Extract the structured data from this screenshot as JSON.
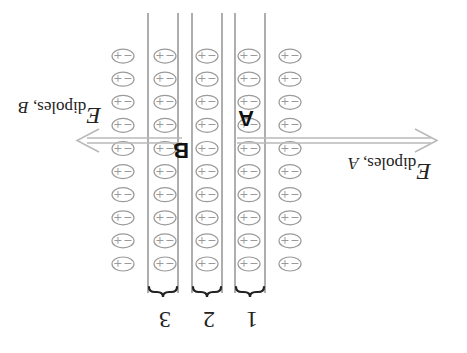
{
  "figure": {
    "orientation": "rotated-180",
    "colors": {
      "dipole": "#9a9a9a",
      "layer_line": "#9a9a9a",
      "arrow": "#b8b8b8",
      "text": "#222222",
      "brace": "#222222"
    },
    "dipole": {
      "plus": "+",
      "minus": "−",
      "rows": 10,
      "columns": 5
    },
    "layers": [
      {
        "id": "1",
        "label": "1"
      },
      {
        "id": "2",
        "label": "2"
      },
      {
        "id": "3",
        "label": "3"
      }
    ],
    "points": {
      "A": "A",
      "B": "B"
    },
    "fields": {
      "A": {
        "symbol": "E",
        "subscript": "dipoles, ",
        "subscript_point": "A",
        "direction": "left"
      },
      "B": {
        "symbol": "E",
        "subscript": "dipoles, ",
        "subscript_point": "B",
        "direction": "right"
      }
    }
  }
}
